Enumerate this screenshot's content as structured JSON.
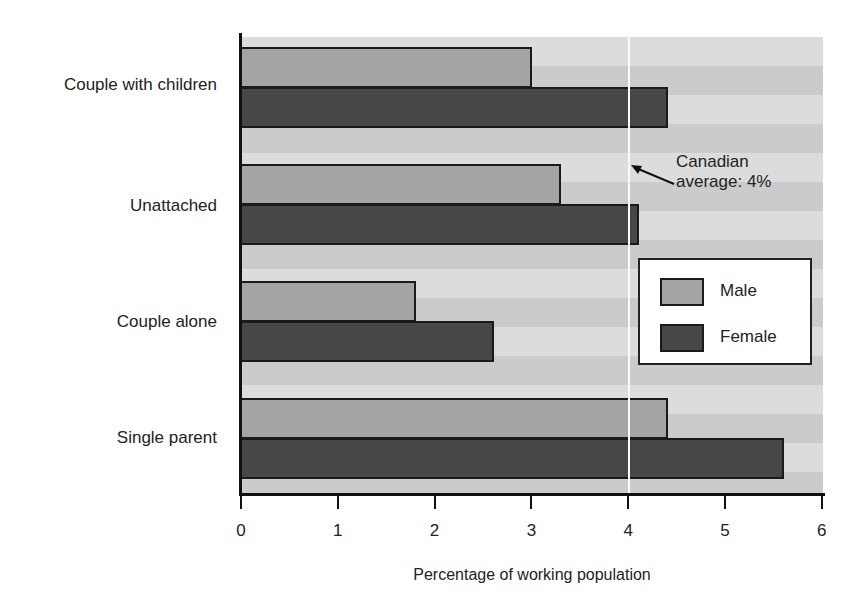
{
  "chart_data": {
    "type": "bar",
    "orientation": "horizontal",
    "categories": [
      "Couple with children",
      "Unattached",
      "Couple alone",
      "Single parent"
    ],
    "series": [
      {
        "name": "Male",
        "values": [
          3.0,
          3.3,
          1.8,
          4.4
        ],
        "color": "#a4a4a4"
      },
      {
        "name": "Female",
        "values": [
          4.4,
          4.1,
          2.6,
          5.6
        ],
        "color": "#474747"
      }
    ],
    "title": "",
    "xlabel": "Percentage of working population",
    "ylabel": "",
    "xlim": [
      0,
      6
    ],
    "xticks": [
      "0",
      "1",
      "2",
      "3",
      "4",
      "5",
      "6"
    ],
    "reference_line": {
      "value": 4,
      "label": "Canadian average: 4%"
    },
    "legend_position": "right-middle",
    "grid": false
  },
  "annotation": {
    "line1": "Canadian",
    "line2": "average: 4%"
  },
  "legend": {
    "male": "Male",
    "female": "Female"
  }
}
